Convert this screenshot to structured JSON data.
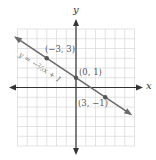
{
  "chart_data": {
    "type": "line",
    "title": "",
    "xlabel": "x",
    "ylabel": "y",
    "xlim": [
      -6,
      6
    ],
    "ylim": [
      -6,
      6
    ],
    "grid": true,
    "series": [
      {
        "name": "y = -2/3 x + 1",
        "equation": "y = −⅔x + 1",
        "slope": -0.6667,
        "intercept": 1,
        "points": [
          {
            "x": -3,
            "y": 3,
            "label": "(−3, 3)"
          },
          {
            "x": 0,
            "y": 1,
            "label": "(0, 1)"
          },
          {
            "x": 3,
            "y": -1,
            "label": "(3, −1)"
          }
        ]
      }
    ],
    "colors": {
      "line": "#6b6b6b",
      "grid": "#dcdcdc",
      "axis": "#333333"
    }
  },
  "labels": {
    "x_axis": "x",
    "y_axis": "y",
    "equation": "y = −⅔x + 1",
    "p1": "(−3, 3)",
    "p2": "(0, 1)",
    "p3": "(3, −1)"
  }
}
